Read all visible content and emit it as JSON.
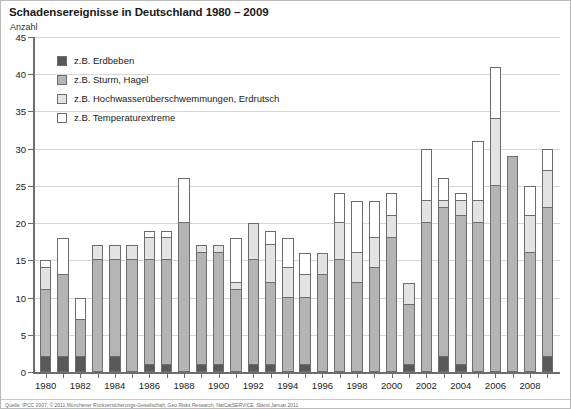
{
  "title": "Schadensereignisse in Deutschland 1980 – 2009",
  "axis_unit": "Anzahl",
  "footer": "Quelle: IPCC 2007, © 2011 Münchener Rückversicherungs-Gesellschaft, Geo Risks Research, NatCatSERVICE, Stand Januar 2011",
  "colors": {
    "erdbeben": "#58595b",
    "sturm_hagel": "#b4b4b4",
    "hochwasser": "#e3e3e3",
    "temperaturextreme": "#ffffff",
    "outline": "#6d6d6d",
    "grid": "#d6d6d6",
    "axis": "#6d6d6d"
  },
  "legend": {
    "items": [
      {
        "label": "z.B. Erdbeben",
        "color_key": "erdbeben"
      },
      {
        "label": "z.B. Sturm, Hagel",
        "color_key": "sturm_hagel"
      },
      {
        "label": "z.B. Hochwasserüberschwemmungen, Erdrutsch",
        "color_key": "hochwasser"
      },
      {
        "label": "z.B. Temperaturextreme",
        "color_key": "temperaturextreme"
      }
    ]
  },
  "chart_data": {
    "type": "bar",
    "subtype": "stacked",
    "title": "Schadensereignisse in Deutschland 1980 – 2009",
    "xlabel": "",
    "ylabel": "Anzahl",
    "ylim": [
      0,
      45
    ],
    "yticks": [
      0,
      5,
      10,
      15,
      20,
      25,
      30,
      35,
      40,
      45
    ],
    "grid": true,
    "legend_position": "upper-left-inside",
    "categories": [
      "1980",
      "1981",
      "1982",
      "1983",
      "1984",
      "1985",
      "1986",
      "1987",
      "1988",
      "1989",
      "1990",
      "1991",
      "1992",
      "1993",
      "1994",
      "1995",
      "1996",
      "1997",
      "1998",
      "1999",
      "2000",
      "2001",
      "2002",
      "2003",
      "2004",
      "2005",
      "2006",
      "2007",
      "2008",
      "2009"
    ],
    "xtick_labels": [
      "1980",
      "",
      "1982",
      "",
      "1984",
      "",
      "1986",
      "",
      "1988",
      "",
      "1900",
      "",
      "1992",
      "",
      "1994",
      "",
      "1996",
      "",
      "1998",
      "",
      "2000",
      "",
      "2002",
      "",
      "2004",
      "",
      "2006",
      "",
      "2008",
      ""
    ],
    "series": [
      {
        "name": "z.B. Erdbeben",
        "color_key": "erdbeben",
        "values": [
          2,
          2,
          2,
          0,
          2,
          0,
          1,
          1,
          0,
          1,
          1,
          0,
          1,
          1,
          0,
          1,
          0,
          0,
          0,
          0,
          0,
          1,
          0,
          2,
          1,
          0,
          0,
          0,
          0,
          2
        ]
      },
      {
        "name": "z.B. Sturm, Hagel",
        "color_key": "sturm_hagel",
        "values": [
          9,
          11,
          5,
          15,
          13,
          15,
          14,
          14,
          20,
          15,
          15,
          11,
          14,
          11,
          10,
          9,
          13,
          15,
          12,
          14,
          18,
          8,
          20,
          20,
          20,
          20,
          25,
          29,
          16,
          20
        ]
      },
      {
        "name": "z.B. Hochwasserüberschwemmungen, Erdrutsch",
        "color_key": "hochwasser",
        "values": [
          3,
          0,
          0,
          2,
          2,
          2,
          3,
          3,
          0,
          1,
          1,
          1,
          5,
          5,
          4,
          3,
          3,
          5,
          4,
          4,
          3,
          3,
          3,
          1,
          2,
          3,
          9,
          0,
          5,
          5
        ]
      },
      {
        "name": "z.B. Temperaturextreme",
        "color_key": "temperaturextreme",
        "values": [
          1,
          5,
          3,
          0,
          0,
          0,
          1,
          1,
          6,
          0,
          0,
          6,
          0,
          2,
          4,
          3,
          0,
          4,
          7,
          5,
          3,
          0,
          7,
          3,
          1,
          8,
          7,
          0,
          4,
          3
        ]
      }
    ],
    "totals": [
      15,
      18,
      10,
      17,
      17,
      17,
      19,
      19,
      26,
      17,
      17,
      18,
      20,
      19,
      18,
      16,
      16,
      24,
      23,
      23,
      24,
      12,
      30,
      26,
      24,
      31,
      41,
      29,
      25,
      30
    ]
  }
}
